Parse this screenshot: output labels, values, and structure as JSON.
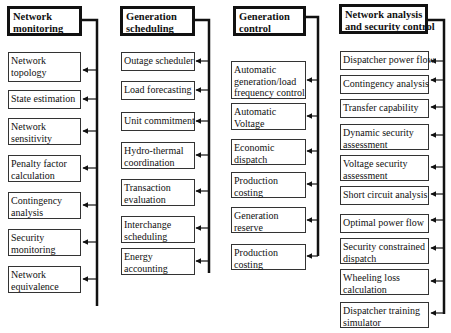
{
  "diagram": {
    "columns": [
      {
        "id": "network-monitoring",
        "header": "Network\nmonitoring",
        "header_lines": [
          "Network",
          "monitoring"
        ],
        "items": [
          {
            "lines": [
              "Network",
              "topology"
            ]
          },
          {
            "lines": [
              "State estimation"
            ]
          },
          {
            "lines": [
              "Network",
              "sensitivity"
            ]
          },
          {
            "lines": [
              "Penalty factor",
              "calculation"
            ]
          },
          {
            "lines": [
              "Contingency",
              "analysis"
            ]
          },
          {
            "lines": [
              "Security",
              "monitoring"
            ]
          },
          {
            "lines": [
              "Network",
              "equivalence"
            ]
          }
        ]
      },
      {
        "id": "generation-scheduling",
        "header_lines": [
          "Generation",
          "scheduling"
        ],
        "items": [
          {
            "lines": [
              "Outage scheduler"
            ]
          },
          {
            "lines": [
              "Load forecasting"
            ]
          },
          {
            "lines": [
              "Unit commitment"
            ]
          },
          {
            "lines": [
              "Hydro-thermal",
              "coordination"
            ]
          },
          {
            "lines": [
              "Transaction",
              "evaluation"
            ]
          },
          {
            "lines": [
              "Interchange",
              "scheduling"
            ]
          },
          {
            "lines": [
              "Energy",
              "accounting"
            ]
          }
        ]
      },
      {
        "id": "generation-control",
        "header_lines": [
          "Generation",
          "control"
        ],
        "items": [
          {
            "lines": [
              "Automatic",
              "generation/load",
              "frequency control"
            ]
          },
          {
            "lines": [
              "Automatic",
              "Voltage"
            ]
          },
          {
            "lines": [
              "Economic",
              "dispatch"
            ]
          },
          {
            "lines": [
              "Production",
              "costing"
            ]
          },
          {
            "lines": [
              "Generation",
              "reserve"
            ]
          },
          {
            "lines": [
              "Production",
              "costing"
            ]
          }
        ]
      },
      {
        "id": "network-analysis-security-control",
        "header_lines": [
          "Network analysis",
          "and security control"
        ],
        "items": [
          {
            "lines": [
              "Dispatcher power flow"
            ]
          },
          {
            "lines": [
              "Contingency analysis"
            ]
          },
          {
            "lines": [
              "Transfer capability"
            ]
          },
          {
            "lines": [
              "Dynamic security",
              "assessment"
            ]
          },
          {
            "lines": [
              "Voltage security",
              "assessment"
            ]
          },
          {
            "lines": [
              "Short circuit analysis"
            ]
          },
          {
            "lines": [
              "Optimal power flow"
            ]
          },
          {
            "lines": [
              "Security constrained",
              "dispatch"
            ]
          },
          {
            "lines": [
              "Wheeling loss",
              "calculation"
            ]
          },
          {
            "lines": [
              "Dispatcher training",
              "simulator"
            ]
          }
        ]
      }
    ],
    "colors": {
      "line": "#111111",
      "box_border": "#333333",
      "background": "#ffffff"
    }
  }
}
